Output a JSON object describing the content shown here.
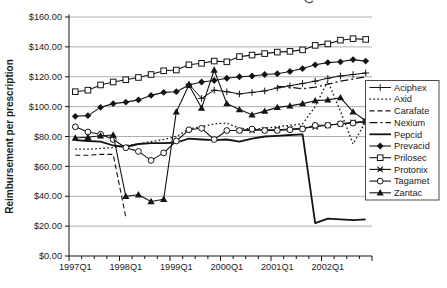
{
  "chart_data": {
    "type": "line",
    "title": "",
    "xlabel": "",
    "ylabel": "Reimbursement per prescription",
    "ylim": [
      0,
      160
    ],
    "ytick_step": 20,
    "y_tick_labels": [
      "$0.00",
      "$20.00",
      "$40.00",
      "$60.00",
      "$80.00",
      "$100.00",
      "$120.00",
      "$140.00",
      "$160.00"
    ],
    "x_categories": [
      "1997Q1",
      "1997Q2",
      "1997Q3",
      "1997Q4",
      "1998Q1",
      "1998Q2",
      "1998Q3",
      "1998Q4",
      "1999Q1",
      "1999Q2",
      "1999Q3",
      "1999Q4",
      "2000Q1",
      "2000Q2",
      "2000Q3",
      "2000Q4",
      "2001Q1",
      "2001Q2",
      "2001Q3",
      "2001Q4",
      "2002Q1",
      "2002Q2",
      "2002Q3",
      "2002Q4"
    ],
    "x_tick_labels": [
      "1997Q1",
      "1998Q1",
      "1999Q1",
      "2000Q1",
      "2001Q1",
      "2002Q1"
    ],
    "grid": "horizontal-gridlines",
    "legend_position": "right",
    "line_color": "#141414",
    "grid_color": "#9a9a9a",
    "series": [
      {
        "name": "Aciphex",
        "line_style": "solid",
        "line_width": 1,
        "marker": "plus",
        "values": [
          null,
          null,
          null,
          null,
          null,
          null,
          null,
          null,
          null,
          115,
          105.5,
          111,
          110,
          108.5,
          109.5,
          110.5,
          112.5,
          114,
          115.5,
          117,
          119,
          120.5,
          121.5,
          122.5
        ]
      },
      {
        "name": "Axid",
        "line_style": "dotted",
        "line_width": 1.3,
        "marker": "none",
        "values": [
          71.5,
          71.5,
          72,
          72.5,
          74,
          75,
          76.5,
          78,
          80,
          85,
          86.5,
          88.5,
          89,
          85.5,
          85,
          85.5,
          86.5,
          87.5,
          88.5,
          100,
          117,
          97,
          75,
          90
        ]
      },
      {
        "name": "Carafate",
        "line_style": "dashed",
        "line_width": 1.1,
        "marker": "none",
        "values": [
          67.5,
          67.5,
          68,
          68,
          26,
          null,
          null,
          null,
          null,
          null,
          null,
          null,
          null,
          null,
          null,
          null,
          null,
          null,
          null,
          null,
          null,
          null,
          null,
          null
        ]
      },
      {
        "name": "Nexium",
        "line_style": "dashdot",
        "line_width": 1.3,
        "marker": "none",
        "values": [
          null,
          null,
          null,
          null,
          null,
          null,
          null,
          null,
          null,
          null,
          null,
          null,
          null,
          null,
          null,
          null,
          113.5,
          113,
          112,
          113,
          115,
          117,
          118.5,
          120
        ]
      },
      {
        "name": "Pepcid",
        "line_style": "solid",
        "line_width": 1.8,
        "marker": "none",
        "values": [
          77.5,
          77,
          76.5,
          74,
          73,
          75,
          75.5,
          75.5,
          76,
          78.5,
          78,
          77.5,
          78,
          76.5,
          78.5,
          80,
          80.5,
          81,
          81.5,
          22,
          25,
          24.5,
          24,
          24.5
        ]
      },
      {
        "name": "Prevacid",
        "line_style": "solid",
        "line_width": 1.1,
        "marker": "diamond",
        "values": [
          93.5,
          94,
          99.5,
          102,
          103,
          104.5,
          107.5,
          109.5,
          110,
          114.5,
          116.5,
          117.5,
          119,
          120,
          120.5,
          121.5,
          122,
          123.5,
          125.5,
          128,
          129.5,
          130,
          131.5,
          130.5
        ]
      },
      {
        "name": "Prilosec",
        "line_style": "solid",
        "line_width": 1.1,
        "marker": "square-open",
        "values": [
          110,
          111,
          114.5,
          116.5,
          118,
          119.5,
          121.5,
          124,
          124.5,
          128,
          129,
          130.5,
          130,
          133.5,
          134.5,
          135.5,
          136.5,
          137,
          138,
          141,
          142,
          144.5,
          145.5,
          145
        ]
      },
      {
        "name": "Protonix",
        "line_style": "solid",
        "line_width": 1.1,
        "marker": "x-star",
        "values": [
          null,
          null,
          null,
          null,
          null,
          null,
          null,
          null,
          null,
          null,
          null,
          null,
          null,
          84,
          84,
          84.5,
          84.5,
          85,
          85.5,
          86.5,
          87.5,
          88.5,
          89.5,
          90
        ]
      },
      {
        "name": "Tagamet",
        "line_style": "solid",
        "line_width": 1.1,
        "marker": "circle-open",
        "values": [
          86.5,
          83,
          81.5,
          78,
          72.5,
          70,
          64,
          69,
          77,
          84.5,
          85.5,
          78,
          84,
          84,
          85,
          84,
          84,
          84.5,
          85,
          87.5,
          87.5,
          88.5,
          89,
          90
        ]
      },
      {
        "name": "Zantac",
        "line_style": "solid",
        "line_width": 1.1,
        "marker": "triangle",
        "values": [
          79,
          79.5,
          80.5,
          81,
          40,
          41,
          36.5,
          38,
          96.5,
          114.5,
          99,
          124.5,
          102,
          98,
          94.5,
          97,
          99.5,
          100.5,
          102,
          104,
          104.5,
          106,
          96.5,
          90.5
        ]
      }
    ],
    "layout": {
      "plot": {
        "left": 69,
        "top": 17,
        "right": 372,
        "bottom": 256
      },
      "legend": {
        "left": 365.5,
        "top": 80.5,
        "width": 73.5,
        "height": 119.5
      }
    }
  }
}
